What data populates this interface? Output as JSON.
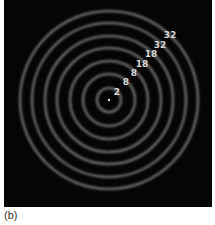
{
  "figure": {
    "caption": "(b)",
    "background_color": "#050505",
    "ring_color": "#8a8a8a",
    "label_color": "#d8d8d8",
    "center": {
      "x": 105,
      "y": 100
    },
    "rings": [
      {
        "radius": 12
      },
      {
        "radius": 26
      },
      {
        "radius": 39
      },
      {
        "radius": 52
      },
      {
        "radius": 64
      },
      {
        "radius": 77
      },
      {
        "radius": 89
      }
    ],
    "labels": [
      {
        "text": "2",
        "x": 113,
        "y": 92
      },
      {
        "text": "8",
        "x": 122,
        "y": 82
      },
      {
        "text": "8",
        "x": 130,
        "y": 73
      },
      {
        "text": "18",
        "x": 138,
        "y": 64
      },
      {
        "text": "18",
        "x": 147,
        "y": 54
      },
      {
        "text": "32",
        "x": 156,
        "y": 45
      },
      {
        "text": "32",
        "x": 166,
        "y": 35
      }
    ]
  }
}
